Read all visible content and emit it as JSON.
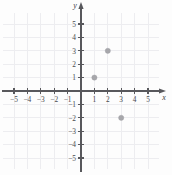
{
  "figure": {
    "kind": "coordinate-plane",
    "axis_labels": {
      "x": "x",
      "y": "y"
    },
    "grid": "on",
    "grid_color": "#ededf0",
    "axis_color": "#58585c",
    "point_color": "#a7a7ab"
  },
  "chart_data": {
    "type": "scatter",
    "title": "",
    "subtitle": "",
    "xlabel": "x",
    "ylabel": "y",
    "xlim": [
      -5.8,
      5.8
    ],
    "ylim": [
      -5.8,
      5.8
    ],
    "grid": true,
    "legend": null,
    "xticks": [
      -5,
      -4,
      -3,
      -2,
      -1,
      1,
      2,
      3,
      4,
      5
    ],
    "yticks": [
      -5,
      -4,
      -3,
      -2,
      -1,
      1,
      2,
      3,
      4,
      5
    ],
    "xtick_labels": [
      "−5",
      "−4",
      "−3",
      "−2",
      "−1",
      "1",
      "2",
      "3",
      "4",
      "5"
    ],
    "ytick_labels": [
      "−5",
      "−4",
      "−3",
      "−2",
      "−1",
      "1",
      "2",
      "3",
      "4",
      "5"
    ],
    "points": [
      {
        "label": "(1, 1)",
        "x": 1,
        "y": 1
      },
      {
        "label": "(2, 3)",
        "x": 2,
        "y": 3
      },
      {
        "label": "(3, -2)",
        "x": 3,
        "y": -2
      }
    ],
    "series": [
      {
        "name": "plotted points",
        "x": [
          1,
          2,
          3
        ],
        "values": [
          1,
          3,
          -2
        ]
      }
    ]
  }
}
